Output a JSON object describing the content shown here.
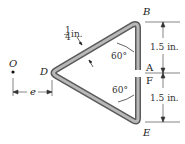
{
  "labels": {
    "B": "B",
    "A": "A",
    "F": "F",
    "E": "E",
    "D": "D",
    "O": "O",
    "e": "e"
  },
  "dimensions": {
    "thickness_num": "1",
    "thickness_den": "4",
    "thickness_unit": "in.",
    "upper_length": "1.5 in.",
    "lower_length": "1.5 in.",
    "angle_upper": "60°",
    "angle_lower": "60°"
  },
  "colors": {
    "bar_dark": "#6e6e6e",
    "bar_light": "#c8c8c8",
    "line": "#333333"
  }
}
